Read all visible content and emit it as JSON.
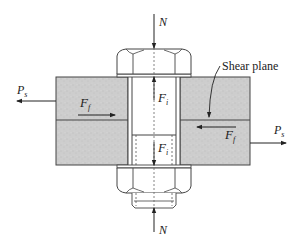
{
  "diagram": {
    "labels": {
      "normal_top": "N",
      "normal_bottom": "N",
      "ps_left_main": "P",
      "ps_left_sub": "s",
      "ps_right_main": "P",
      "ps_right_sub": "s",
      "ff_top_main": "F",
      "ff_top_sub": "f",
      "ff_bottom_main": "F",
      "ff_bottom_sub": "f",
      "fi_top_main": "F",
      "fi_top_sub": "i",
      "fi_bottom_main": "F",
      "fi_bottom_sub": "i",
      "shear_plane": "Shear plane"
    },
    "colors": {
      "plate_fill": "#cfcfcf",
      "line": "#333333",
      "background": "#ffffff"
    }
  }
}
